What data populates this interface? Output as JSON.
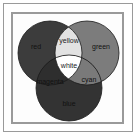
{
  "diagram": {
    "type": "venn",
    "sets": [
      {
        "name": "red",
        "label": "red",
        "cx": 50,
        "cy": 53,
        "r": 32
      },
      {
        "name": "green",
        "label": "green",
        "cx": 87,
        "cy": 53,
        "r": 32
      },
      {
        "name": "blue",
        "label": "blue",
        "cx": 69,
        "cy": 88,
        "r": 33
      }
    ],
    "regions": {
      "red": {
        "label": "red",
        "fill": "#3c3c3c",
        "text_color": "#111111"
      },
      "green": {
        "label": "green",
        "fill": "#7c7c7c",
        "text_color": "#111111"
      },
      "blue": {
        "label": "blue",
        "fill": "#333333",
        "text_color": "#111111"
      },
      "yellow": {
        "label": "yellow",
        "fill": "#e2e2e2",
        "text_color": "#222222"
      },
      "cyan": {
        "label": "cyan",
        "fill": "#7a7a7a",
        "text_color": "#111111"
      },
      "magenta": {
        "label": "magenta",
        "fill": "#2e2e2e",
        "text_color": "#111111"
      },
      "white": {
        "label": "white",
        "fill": "#ffffff",
        "text_color": "#222222"
      }
    },
    "outline_color": "#1a1a1a",
    "frame_color": "#9a9a9a"
  }
}
